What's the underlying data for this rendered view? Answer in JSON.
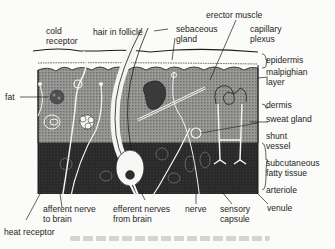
{
  "diagram": {
    "colors": {
      "background": "#fbfbf9",
      "epidermis": "#f4f4f2",
      "dermis": "#8a8a88",
      "subcutaneous": "#2c2c2c",
      "line": "#1c1c1c"
    },
    "labels": {
      "cold_receptor": [
        "cold",
        "receptor"
      ],
      "hair_in_follicle": "hair in follicle",
      "sebaceous_gland": [
        "sebaceous",
        "gland"
      ],
      "erector_muscle": "erector muscle",
      "capillary_plexus": [
        "capillary",
        "plexus"
      ],
      "epidermis": "epidermis",
      "malpighian_layer": [
        "malpighian",
        "layer"
      ],
      "fat": "fat",
      "dermis": "dermis",
      "sweat_gland": "sweat gland",
      "shunt_vessel": [
        "shunt",
        "vessel"
      ],
      "subcutaneous_fatty_tissue": [
        "subcutaneous",
        "fatty tissue"
      ],
      "arteriole": "arteriole",
      "venule": "venule",
      "afferent_nerve": [
        "afferent nerve",
        "to brain"
      ],
      "efferent_nerves": [
        "efferent nerves",
        "from brain"
      ],
      "nerve": "nerve",
      "sensory_capsule": [
        "sensory",
        "capsule"
      ],
      "heat_receptor": "heat receptor"
    }
  }
}
